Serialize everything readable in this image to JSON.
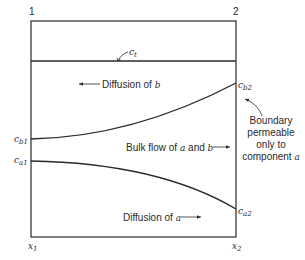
{
  "diagram": {
    "type": "diffusion-through-film",
    "positions": {
      "left_top": "1",
      "right_top": "2",
      "left_bottom": {
        "base": "x",
        "sub": "1"
      },
      "right_bottom": {
        "base": "x",
        "sub": "2"
      }
    },
    "curves": {
      "total": {
        "base": "c",
        "sub": "t"
      },
      "b_left": {
        "base": "c",
        "sub": "b1"
      },
      "b_right": {
        "base": "c",
        "sub": "b2"
      },
      "a_left": {
        "base": "c",
        "sub": "a1"
      },
      "a_right": {
        "base": "c",
        "sub": "a2"
      }
    },
    "annotations": {
      "diffusion_b": {
        "prefix": "Diffusion of ",
        "var": "b"
      },
      "bulk_flow": {
        "prefix": "Bulk flow of ",
        "var1": "a",
        "mid": " and ",
        "var2": "b"
      },
      "diffusion_a": {
        "prefix": "Diffusion of ",
        "var": "a"
      },
      "boundary": {
        "line1": "Boundary",
        "line2": "permeable",
        "line3": "only to",
        "line4_prefix": "component ",
        "line4_var": "a"
      }
    },
    "colors": {
      "ink": "#2a2a2a",
      "background": "#ffffff"
    }
  }
}
